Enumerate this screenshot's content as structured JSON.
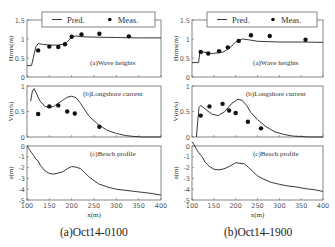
{
  "figure": {
    "panels": [
      {
        "caption": "(a)Oct14-0100",
        "x0": 27,
        "x1": 161
      },
      {
        "caption": "(b)Oct14-1900",
        "x0": 192,
        "x1": 323
      }
    ],
    "legend": {
      "pred": "Pred.",
      "meas": "Meas."
    },
    "xlabel": "x(m)",
    "xticks": [
      100,
      150,
      200,
      250,
      300,
      350,
      400
    ]
  },
  "chart_data": [
    {
      "type": "line",
      "panel": "(a)Oct14-0100",
      "subplot": "(a)Wave heights",
      "ylabel": "Hrms(m)",
      "ylim": [
        0,
        1.5
      ],
      "yticks": [
        0,
        0.5,
        1,
        1.5
      ],
      "xlim": [
        100,
        400
      ],
      "series": [
        {
          "name": "Pred.",
          "x": [
            100,
            110,
            115,
            120,
            125,
            135,
            150,
            170,
            180,
            190,
            200,
            210,
            220,
            250,
            300,
            350,
            400
          ],
          "values": [
            0.3,
            0.3,
            0.55,
            0.8,
            0.88,
            0.86,
            0.84,
            0.84,
            0.86,
            0.92,
            1.05,
            1.08,
            1.06,
            1.05,
            1.04,
            1.03,
            1.03
          ]
        },
        {
          "name": "Meas.",
          "x": [
            125,
            150,
            170,
            185,
            200,
            222,
            262,
            328
          ],
          "values": [
            0.7,
            0.8,
            0.79,
            0.86,
            1.06,
            1.12,
            1.14,
            1.07
          ]
        }
      ]
    },
    {
      "type": "line",
      "panel": "(a)Oct14-0100",
      "subplot": "(b)Longshore current",
      "ylabel": "V(m/s)",
      "ylim": [
        0,
        1
      ],
      "yticks": [
        0,
        0.5,
        1
      ],
      "xlim": [
        100,
        400
      ],
      "series": [
        {
          "name": "Pred.",
          "x": [
            108,
            112,
            116,
            120,
            128,
            140,
            150,
            160,
            170,
            180,
            190,
            200,
            210,
            220,
            230,
            240,
            260,
            280,
            300,
            320,
            340,
            360,
            380,
            400
          ],
          "values": [
            0.7,
            0.9,
            0.95,
            0.88,
            0.72,
            0.6,
            0.58,
            0.6,
            0.66,
            0.72,
            0.78,
            0.8,
            0.77,
            0.66,
            0.52,
            0.4,
            0.24,
            0.13,
            0.07,
            0.03,
            0.01,
            0.0,
            0.0,
            0.0
          ]
        },
        {
          "name": "Meas.",
          "x": [
            125,
            150,
            170,
            190,
            207,
            262
          ],
          "values": [
            0.45,
            0.6,
            0.62,
            0.5,
            0.46,
            0.2
          ]
        }
      ]
    },
    {
      "type": "line",
      "panel": "(a)Oct14-0100",
      "subplot": "(c)Beach profile",
      "ylabel": "z(m)",
      "ylim": [
        -5,
        0
      ],
      "yticks": [
        0,
        -1,
        -2,
        -3,
        -4,
        -5
      ],
      "xlim": [
        100,
        400
      ],
      "series": [
        {
          "name": "Profile",
          "x": [
            100,
            105,
            110,
            115,
            120,
            125,
            130,
            140,
            150,
            160,
            170,
            180,
            190,
            200,
            210,
            220,
            230,
            240,
            250,
            260,
            280,
            300,
            320,
            340,
            360,
            380,
            400
          ],
          "values": [
            0,
            -0.3,
            -0.6,
            -0.9,
            -1.2,
            -1.4,
            -1.8,
            -2.3,
            -2.55,
            -2.6,
            -2.5,
            -2.4,
            -2.1,
            -1.9,
            -1.95,
            -2.1,
            -2.5,
            -2.9,
            -3.2,
            -3.5,
            -3.8,
            -4.0,
            -4.1,
            -4.2,
            -4.3,
            -4.4,
            -4.55
          ]
        }
      ]
    },
    {
      "type": "line",
      "panel": "(b)Oct14-1900",
      "subplot": "(a)Wave heights",
      "ylabel": "Hrms(m)",
      "ylim": [
        0,
        1.5
      ],
      "yticks": [
        0,
        0.5,
        1,
        1.5
      ],
      "xlim": [
        100,
        400
      ],
      "series": [
        {
          "name": "Pred.",
          "x": [
            100,
            115,
            118,
            125,
            140,
            150,
            170,
            185,
            200,
            215,
            230,
            250,
            300,
            350,
            400
          ],
          "values": [
            0.38,
            0.38,
            0.65,
            0.66,
            0.62,
            0.62,
            0.65,
            0.75,
            0.92,
            1.0,
            0.98,
            0.94,
            0.92,
            0.92,
            0.91
          ]
        },
        {
          "name": "Meas.",
          "x": [
            120,
            137,
            162,
            182,
            207,
            235,
            278,
            360
          ],
          "values": [
            0.66,
            0.62,
            0.68,
            0.78,
            0.95,
            1.1,
            1.08,
            0.98
          ]
        }
      ]
    },
    {
      "type": "line",
      "panel": "(b)Oct14-1900",
      "subplot": "(b)Longshore current",
      "ylabel": "V(m/s)",
      "ylim": [
        0,
        1
      ],
      "yticks": [
        0,
        0.5,
        1
      ],
      "xlim": [
        100,
        400
      ],
      "series": [
        {
          "name": "Pred.",
          "x": [
            110,
            113,
            116,
            120,
            130,
            145,
            160,
            175,
            190,
            205,
            215,
            225,
            235,
            250,
            270,
            290,
            310,
            330,
            350,
            370,
            400
          ],
          "values": [
            0.0,
            0.3,
            0.58,
            0.62,
            0.55,
            0.45,
            0.42,
            0.5,
            0.65,
            0.74,
            0.72,
            0.62,
            0.48,
            0.34,
            0.2,
            0.1,
            0.05,
            0.02,
            0.01,
            0.0,
            0.0
          ]
        },
        {
          "name": "Meas.",
          "x": [
            120,
            140,
            170,
            185,
            200,
            228,
            258
          ],
          "values": [
            0.42,
            0.6,
            0.65,
            0.52,
            0.47,
            0.3,
            0.17
          ]
        }
      ]
    },
    {
      "type": "line",
      "panel": "(b)Oct14-1900",
      "subplot": "(c)Beach profile",
      "ylabel": "z(m)",
      "ylim": [
        -5,
        0
      ],
      "yticks": [
        0,
        -1,
        -2,
        -3,
        -4,
        -5
      ],
      "xlim": [
        100,
        400
      ],
      "series": [
        {
          "name": "Profile",
          "x": [
            100,
            105,
            110,
            115,
            120,
            125,
            130,
            140,
            150,
            160,
            170,
            180,
            190,
            200,
            210,
            220,
            230,
            240,
            250,
            260,
            280,
            300,
            320,
            340,
            360,
            380,
            400
          ],
          "values": [
            0.4,
            0.1,
            -0.3,
            -0.6,
            -0.85,
            -1.1,
            -1.5,
            -1.9,
            -2.15,
            -2.2,
            -2.15,
            -2.0,
            -1.8,
            -1.55,
            -1.6,
            -1.65,
            -2.0,
            -2.4,
            -2.75,
            -3.0,
            -3.35,
            -3.55,
            -3.7,
            -3.8,
            -3.95,
            -4.05,
            -4.2
          ]
        }
      ]
    }
  ]
}
